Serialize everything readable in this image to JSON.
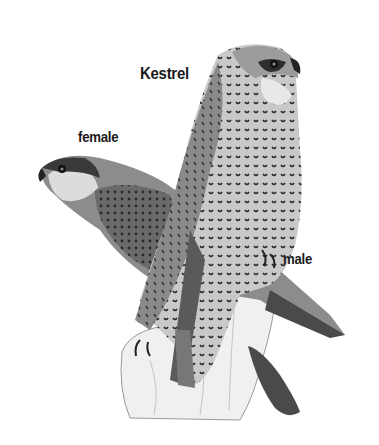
{
  "illustration": {
    "title": "Kestrel",
    "labels": {
      "female": "female",
      "male": "male"
    },
    "subjects": [
      "female-kestrel",
      "male-kestrel",
      "tree-stump"
    ],
    "palette": {
      "background": "#ffffff",
      "text": "#1a1a1a",
      "plumage_dark": "#3a3a3a",
      "plumage_mid": "#7a7a7a",
      "plumage_light": "#c8c8c8",
      "stump": "#eeeeee"
    }
  }
}
